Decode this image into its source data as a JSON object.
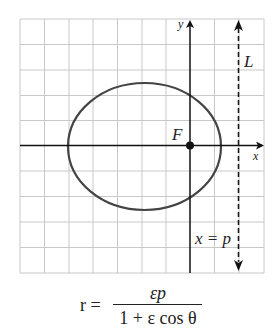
{
  "diagram": {
    "labels": {
      "y_axis": "y",
      "x_axis": "x",
      "directrix": "L",
      "focus": "F",
      "directrix_equation": "x = p"
    },
    "formula": {
      "lhs": "r =",
      "numerator": "εp",
      "denominator": "1 + ε cos θ"
    },
    "colors": {
      "grid": "#c8c8c8",
      "axes": "#111111",
      "ellipse": "#444444",
      "directrix": "#111111"
    },
    "grid": {
      "columns": 10,
      "rows": 10
    }
  }
}
